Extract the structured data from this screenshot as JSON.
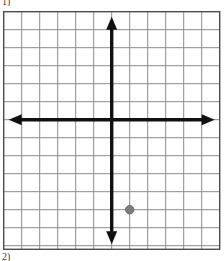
{
  "page": {
    "label_top": "1)",
    "label_bottom": "2)",
    "background_color": "#ffffff"
  },
  "graph": {
    "title": "",
    "grid": {
      "columns": 12,
      "rows": 13,
      "cell_size_px": 18,
      "line_color": "#8c8c8c",
      "border_color": "#4d4d4d",
      "show_grid": true,
      "show_tick_labels": false,
      "show_axis_numbers": false
    },
    "axes": {
      "color": "#111111",
      "x_axis_label": "",
      "y_axis_label": "",
      "x_arrow_left": true,
      "x_arrow_right": true,
      "y_arrow_up": true,
      "y_arrow_down": true,
      "origin_column": 6,
      "origin_row": 6
    }
  },
  "chart_data": {
    "type": "scatter",
    "title": "",
    "xlabel": "",
    "ylabel": "",
    "xlim": [
      -6,
      6
    ],
    "ylim": [
      -7,
      6
    ],
    "xticks": [
      -6,
      -5,
      -4,
      -3,
      -2,
      -1,
      0,
      1,
      2,
      3,
      4,
      5,
      6
    ],
    "yticks": [
      -7,
      -6,
      -5,
      -4,
      -3,
      -2,
      -1,
      0,
      1,
      2,
      3,
      4,
      5,
      6
    ],
    "grid": true,
    "legend": false,
    "point_color": "#7d7d7d",
    "points": [
      {
        "label": "",
        "x": 1,
        "y": -5
      }
    ]
  }
}
